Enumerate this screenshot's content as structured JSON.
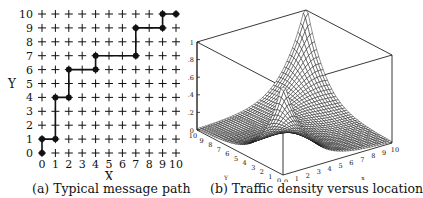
{
  "figure": {
    "panel_a": {
      "caption": "(a) Typical message path",
      "xlabel": "X",
      "ylabel": "Y",
      "x_ticks": [
        "0",
        "1",
        "2",
        "3",
        "4",
        "5",
        "6",
        "7",
        "8",
        "9",
        "10"
      ],
      "y_ticks": [
        "0",
        "1",
        "2",
        "3",
        "4",
        "5",
        "6",
        "7",
        "8",
        "9",
        "10"
      ]
    },
    "panel_b": {
      "caption": "(b) Traffic density versus location",
      "xlabel": "x",
      "ylabel": "Y",
      "z_ticks": [
        "0",
        ".2",
        ".4",
        ".6",
        ".8",
        "1"
      ],
      "x_ticks": [
        "0",
        "1",
        "2",
        "3",
        "4",
        "5",
        "6",
        "7",
        "8",
        "9",
        "10"
      ],
      "y_ticks": [
        "0",
        "1",
        "2",
        "3",
        "4",
        "5",
        "6",
        "7",
        "8",
        "9",
        "10"
      ]
    }
  },
  "chart_data": [
    {
      "type": "line",
      "title": "(a) Typical message path",
      "xlabel": "X",
      "ylabel": "Y",
      "xlim": [
        0,
        10
      ],
      "ylim": [
        0,
        10
      ],
      "grid": "plus-marker lattice 11x11",
      "series": [
        {
          "name": "message path",
          "x": [
            0,
            0,
            1,
            1,
            2,
            2,
            4,
            4,
            7,
            7,
            9,
            9,
            10
          ],
          "y": [
            0,
            1,
            1,
            4,
            4,
            6,
            6,
            7,
            7,
            9,
            9,
            10,
            10
          ]
        }
      ]
    },
    {
      "type": "surface",
      "title": "(b) Traffic density versus location",
      "xlabel": "x",
      "ylabel": "Y",
      "zlabel": "",
      "xlim": [
        0,
        10
      ],
      "ylim": [
        0,
        10
      ],
      "zlim": [
        0,
        1
      ],
      "z_ticks": [
        0,
        0.2,
        0.4,
        0.6,
        0.8,
        1
      ],
      "description": "Mesh surface peaking at 1 at corners (0,0) and (10,10), forming a ridge along the diagonal x=y and decaying to ~0 at corners (0,10) and (10,0)"
    }
  ]
}
